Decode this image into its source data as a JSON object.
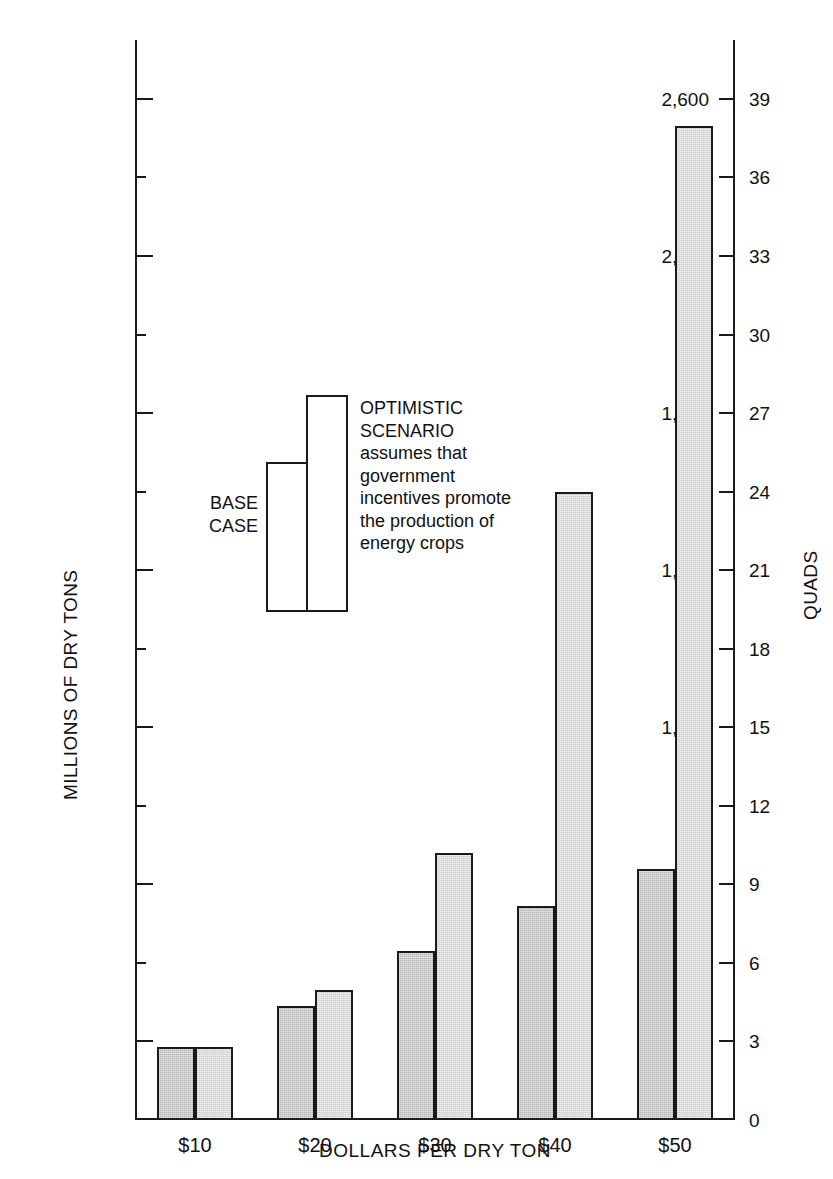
{
  "chart_data": {
    "type": "bar",
    "title": "",
    "subtitle": "",
    "xlabel": "DOLLARS PER DRY TON",
    "ylabel": "MILLIONS OF DRY TONS",
    "y2label": "QUADS",
    "categories": [
      "$10",
      "$20",
      "$30",
      "$40",
      "$50"
    ],
    "series": [
      {
        "name": "BASE CASE",
        "values": [
          185,
          290,
          430,
          545,
          640
        ],
        "color": "#b3b3b3"
      },
      {
        "name": "OPTIMISTIC SCENARIO",
        "values": [
          185,
          330,
          680,
          1600,
          2530
        ],
        "color": "#dcdcdc"
      }
    ],
    "ylim": [
      0,
      2750
    ],
    "y2lim": [
      0,
      41.25
    ],
    "yticks": [
      200,
      400,
      600,
      800,
      1000,
      1200,
      1400,
      1600,
      1800,
      2000,
      2200,
      2400,
      2600
    ],
    "ytick_labels": [
      "200",
      "",
      "600",
      "",
      "1,000",
      "",
      "1,400",
      "",
      "1,800",
      "",
      "2,200",
      "",
      "2,600"
    ],
    "y2ticks": [
      0,
      3,
      6,
      9,
      12,
      15,
      18,
      21,
      24,
      27,
      30,
      33,
      36,
      39
    ],
    "y2tick_labels": [
      "0",
      "3",
      "6",
      "9",
      "12",
      "15",
      "18",
      "21",
      "24",
      "27",
      "30",
      "33",
      "36",
      "39"
    ],
    "grid": false,
    "legend_position": "inside-upper-left",
    "annotations": [
      "OPTIMISTIC SCENARIO assumes that government incentives promote the production of energy crops"
    ]
  },
  "legend": {
    "base_label": "BASE\nCASE",
    "optimistic_label": "OPTIMISTIC\nSCENARIO\nassumes that\ngovernment\nincentives promote\nthe production of\nenergy crops",
    "base_swatch_color": "#b3b3b3",
    "optimistic_swatch_color": "#dcdcdc"
  },
  "axes": {
    "left_title": "MILLIONS OF DRY TONS",
    "right_title": "QUADS",
    "bottom_title": "DOLLARS PER DRY TON"
  }
}
